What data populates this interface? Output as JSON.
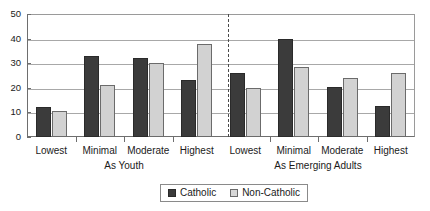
{
  "chart_data": {
    "type": "bar",
    "title": "",
    "xlabel": "",
    "ylabel": "",
    "ylim": [
      0,
      50
    ],
    "yticks": [
      0,
      10,
      20,
      30,
      40,
      50
    ],
    "grid": true,
    "legend_position": "bottom-center",
    "categories": [
      "Lowest",
      "Minimal",
      "Moderate",
      "Highest"
    ],
    "panels": [
      {
        "name": "As Youth",
        "series": [
          {
            "name": "Catholic",
            "values": [
              12,
              33,
              32,
              23
            ]
          },
          {
            "name": "Non-Catholic",
            "values": [
              10.5,
              21,
              30,
              38
            ]
          }
        ]
      },
      {
        "name": "As Emerging Adults",
        "series": [
          {
            "name": "Catholic",
            "values": [
              26,
              40,
              20.5,
              12.5
            ]
          },
          {
            "name": "Non-Catholic",
            "values": [
              20,
              28.5,
              24,
              26
            ]
          }
        ]
      }
    ],
    "legend": [
      {
        "label": "Catholic",
        "color": "#3b3b3b"
      },
      {
        "label": "Non-Catholic",
        "color": "#d2d2d2"
      }
    ]
  },
  "axis": {
    "y_tick_labels": [
      "0",
      "10",
      "20",
      "30",
      "40",
      "50"
    ]
  },
  "panel_labels": [
    "As Youth",
    "As Emerging Adults"
  ],
  "category_labels": [
    "Lowest",
    "Minimal",
    "Moderate",
    "Highest"
  ],
  "legend": {
    "catholic_label": "Catholic",
    "noncatholic_label": "Non-Catholic"
  }
}
